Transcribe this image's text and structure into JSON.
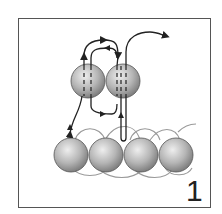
{
  "diagram": {
    "type": "beading-stitch-step",
    "step_number": "1",
    "bottom_row_beads": 4,
    "top_row_beads": 2,
    "colors": {
      "frame": "#555555",
      "thread": "#222222",
      "loose_thread": "#888888",
      "bead_light": "#e8e8e8",
      "bead_dark": "#8a8a8a"
    }
  }
}
